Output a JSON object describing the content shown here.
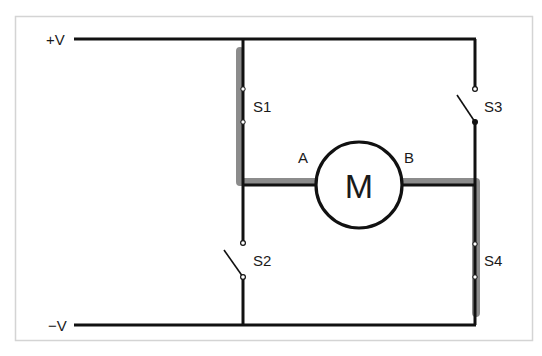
{
  "diagram": {
    "type": "H-bridge motor circuit",
    "rails": {
      "positive_label": "+V",
      "negative_label": "−V"
    },
    "motor": {
      "label": "M",
      "terminal_a": "A",
      "terminal_b": "B"
    },
    "switches": [
      {
        "label": "S1",
        "position": "top-left",
        "state": "closed"
      },
      {
        "label": "S2",
        "position": "bottom-left",
        "state": "open"
      },
      {
        "label": "S3",
        "position": "top-right",
        "state": "open"
      },
      {
        "label": "S4",
        "position": "bottom-right",
        "state": "closed"
      }
    ],
    "current_path": "+V → S1 → A → M → B → S4 → −V",
    "colors": {
      "wire": "#111111",
      "highlight": "#8c8c8c",
      "frame": "#d4d4d4",
      "background": "#ffffff"
    }
  }
}
